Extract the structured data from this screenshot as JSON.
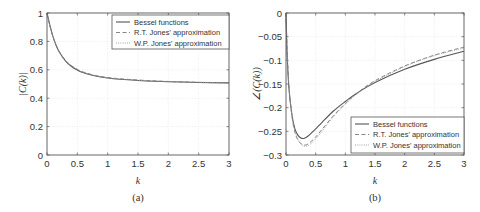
{
  "chart_data": [
    {
      "type": "line",
      "title": "",
      "caption": "(a)",
      "xlabel": "k",
      "ylabel": "|C(k)|",
      "xlim": [
        0,
        3
      ],
      "ylim": [
        0,
        1
      ],
      "xticks": [
        "0",
        "0.5",
        "1",
        "1.5",
        "2",
        "2.5",
        "3"
      ],
      "yticks": [
        "0",
        "0.2",
        "0.4",
        "0.6",
        "0.8",
        "1"
      ],
      "grid": true,
      "legend_position": "upper right",
      "x": [
        0,
        0.05,
        0.1,
        0.15,
        0.2,
        0.3,
        0.4,
        0.5,
        0.6,
        0.8,
        1.0,
        1.2,
        1.5,
        2.0,
        2.5,
        3.0
      ],
      "series": [
        {
          "name": "Bessel functions",
          "style": "solid",
          "values": [
            1.0,
            0.909,
            0.832,
            0.773,
            0.727,
            0.665,
            0.625,
            0.598,
            0.579,
            0.556,
            0.542,
            0.533,
            0.525,
            0.516,
            0.511,
            0.508
          ]
        },
        {
          "name": "R.T. Jones' approximation",
          "style": "dashed",
          "values": [
            1.0,
            0.905,
            0.83,
            0.773,
            0.73,
            0.669,
            0.63,
            0.603,
            0.584,
            0.56,
            0.546,
            0.537,
            0.528,
            0.518,
            0.512,
            0.509
          ]
        },
        {
          "name": "W.P. Jones' approximation",
          "style": "dotted",
          "values": [
            1.0,
            0.907,
            0.831,
            0.772,
            0.728,
            0.667,
            0.628,
            0.601,
            0.582,
            0.558,
            0.544,
            0.535,
            0.526,
            0.517,
            0.512,
            0.508
          ]
        }
      ]
    },
    {
      "type": "line",
      "title": "",
      "caption": "(b)",
      "xlabel": "k",
      "ylabel": "∠(C(k))",
      "xlim": [
        0,
        3
      ],
      "ylim": [
        -0.3,
        0
      ],
      "xticks": [
        "0",
        "0.5",
        "1",
        "1.5",
        "2",
        "2.5",
        "3"
      ],
      "yticks": [
        "0",
        "−0.05",
        "−0.1",
        "−0.15",
        "−0.2",
        "−0.25",
        "−0.3"
      ],
      "grid": true,
      "legend_position": "lower right",
      "x": [
        0,
        0.02,
        0.05,
        0.1,
        0.15,
        0.2,
        0.25,
        0.3,
        0.35,
        0.4,
        0.5,
        0.6,
        0.8,
        1.0,
        1.2,
        1.5,
        2.0,
        2.5,
        3.0
      ],
      "series": [
        {
          "name": "Bessel functions",
          "style": "solid",
          "values": [
            0,
            -0.09,
            -0.16,
            -0.215,
            -0.245,
            -0.258,
            -0.264,
            -0.265,
            -0.262,
            -0.257,
            -0.245,
            -0.232,
            -0.207,
            -0.187,
            -0.169,
            -0.147,
            -0.119,
            -0.098,
            -0.081
          ]
        },
        {
          "name": "R.T. Jones' approximation",
          "style": "dashed",
          "values": [
            0,
            -0.08,
            -0.155,
            -0.218,
            -0.252,
            -0.268,
            -0.276,
            -0.279,
            -0.278,
            -0.274,
            -0.262,
            -0.247,
            -0.217,
            -0.191,
            -0.169,
            -0.143,
            -0.112,
            -0.089,
            -0.072
          ]
        },
        {
          "name": "W.P. Jones' approximation",
          "style": "dotted",
          "values": [
            0,
            -0.085,
            -0.158,
            -0.216,
            -0.249,
            -0.266,
            -0.276,
            -0.281,
            -0.281,
            -0.278,
            -0.266,
            -0.251,
            -0.219,
            -0.193,
            -0.171,
            -0.145,
            -0.113,
            -0.09,
            -0.074
          ]
        }
      ]
    }
  ],
  "legend": {
    "items": [
      "Bessel functions",
      "R.T. Jones' approximation",
      "W.P. Jones' approximation"
    ]
  },
  "colors": {
    "bessel": "#555555",
    "rt_jones": "#777777",
    "wp_jones": "#9a9a9a",
    "axes": "#555555",
    "grid": "#dddddd"
  }
}
